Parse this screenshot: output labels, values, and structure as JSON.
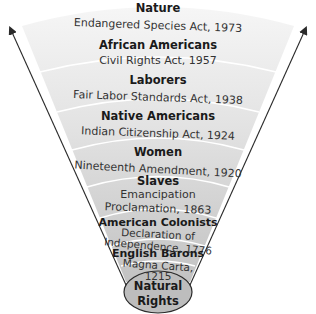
{
  "diagram": {
    "base": {
      "line1": "Natural",
      "line2": "Rights"
    },
    "bands": [
      {
        "group": "Nature",
        "law_lines": [
          "Endangered Species Act, 1973"
        ]
      },
      {
        "group": "African Americans",
        "law_lines": [
          "Civil Rights Act, 1957"
        ]
      },
      {
        "group": "Laborers",
        "law_lines": [
          "Fair Labor Standards Act, 1938"
        ]
      },
      {
        "group": "Native Americans",
        "law_lines": [
          "Indian Citizenship Act, 1924"
        ]
      },
      {
        "group": "Women",
        "law_lines": [
          "Nineteenth Amendment, 1920"
        ]
      },
      {
        "group": "Slaves",
        "law_lines": [
          "Emancipation",
          "Proclamation, 1863"
        ]
      },
      {
        "group": "American Colonists",
        "law_lines": [
          "Declaration of",
          "Independence, 1776"
        ]
      },
      {
        "group": "English Barons",
        "law_lines": [
          "Magna Carta,",
          "1215"
        ]
      }
    ],
    "colors": {
      "fan_top": "#f5f5f5",
      "fan_bottom": "#c4c4c4",
      "divider": "#ffffff",
      "arrow": "#2a2a2a",
      "base_fill": "#bdbdbd",
      "base_stroke": "#2a2a2a"
    }
  }
}
